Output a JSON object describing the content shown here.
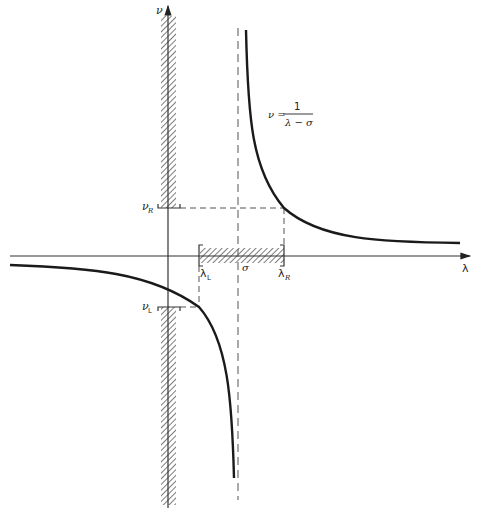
{
  "diagram": {
    "type": "hyperbola-transform",
    "axes": {
      "vertical_label": "ν",
      "horizontal_label": "λ"
    },
    "equation": {
      "lhs": "ν =",
      "numerator": "1",
      "denominator": "λ − σ"
    },
    "markers": {
      "sigma": "σ",
      "lambda_L": {
        "base": "λ",
        "sub": "L"
      },
      "lambda_R": {
        "base": "λ",
        "sub": "R"
      },
      "nu_R": {
        "base": "ν",
        "sub": "R"
      },
      "nu_L": {
        "base": "ν",
        "sub": "L"
      }
    },
    "colors": {
      "curve": "#1a1a1a",
      "axis": "#333333",
      "dashed": "#555555",
      "hatch": "#444444"
    }
  }
}
